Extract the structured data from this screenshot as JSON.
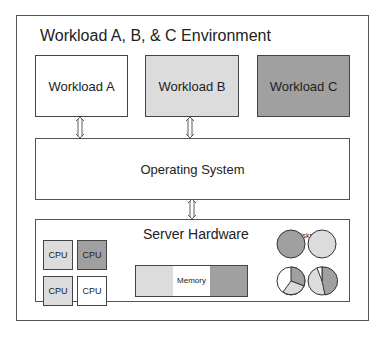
{
  "title": "Workload A, B, & C Environment",
  "workloads": [
    {
      "label": "Workload A",
      "color": "#ffffff"
    },
    {
      "label": "Workload B",
      "color": "#dcdcdc"
    },
    {
      "label": "Workload C",
      "color": "#a0a0a0"
    }
  ],
  "os": {
    "label": "Operating System"
  },
  "hardware": {
    "label": "Server Hardware",
    "cpus": [
      {
        "label": "CPU",
        "color": "#dcdcdc"
      },
      {
        "label": "CPU",
        "color": "#a0a0a0"
      },
      {
        "label": "CPU",
        "color": "#dcdcdc"
      },
      {
        "label": "CPU",
        "color": "#ffffff"
      }
    ],
    "memory": {
      "label": "Memory",
      "segments": [
        "#dcdcdc",
        "#ffffff",
        "#a0a0a0"
      ]
    },
    "disks": {
      "label": "Disks"
    }
  }
}
